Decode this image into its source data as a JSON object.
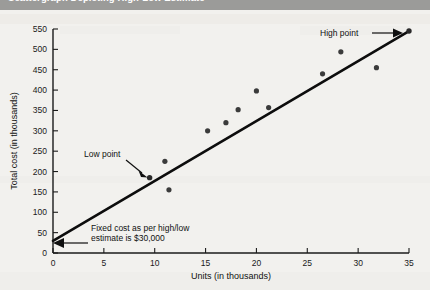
{
  "title": "Scattergraph Depicting High-Low Estimate",
  "chart_data": {
    "type": "scatter",
    "title": "Scattergraph Depicting High-Low Estimate",
    "xlabel": "Units (in thousands)",
    "ylabel": "Total cost (in thousands)",
    "xlim": [
      0,
      35
    ],
    "ylim": [
      0,
      550
    ],
    "xticks": [
      0,
      5,
      10,
      15,
      20,
      25,
      30,
      35
    ],
    "yticks": [
      0,
      50,
      100,
      150,
      200,
      250,
      300,
      350,
      400,
      450,
      500,
      550
    ],
    "grid": false,
    "legend": "none",
    "points": [
      {
        "x": 9.5,
        "y": 185,
        "label": "Low point"
      },
      {
        "x": 11.0,
        "y": 225
      },
      {
        "x": 11.4,
        "y": 155
      },
      {
        "x": 15.2,
        "y": 300
      },
      {
        "x": 17.0,
        "y": 320
      },
      {
        "x": 18.2,
        "y": 352
      },
      {
        "x": 20.0,
        "y": 398
      },
      {
        "x": 21.2,
        "y": 357
      },
      {
        "x": 26.5,
        "y": 440
      },
      {
        "x": 28.3,
        "y": 494
      },
      {
        "x": 31.8,
        "y": 455
      },
      {
        "x": 35.0,
        "y": 545,
        "label": "High point"
      }
    ],
    "trendline": {
      "name": "High-low cost line",
      "x0": 0,
      "y0": 30,
      "x1": 35,
      "y1": 545,
      "intercept": 30,
      "slope": 14.71
    },
    "annotations": [
      {
        "name": "high-point",
        "text": "High point",
        "x": 35,
        "y": 545
      },
      {
        "name": "low-point",
        "text": "Low point",
        "x": 9.5,
        "y": 185
      },
      {
        "name": "fixed-cost",
        "text_line1": "Fixed cost as per high/low",
        "text_line2": "estimate is $30,000",
        "x": 0,
        "y": 30
      }
    ]
  },
  "colors": {
    "title_band": "#9b9b99",
    "page_background": "#f2f1ee",
    "axis": "#1b1b1b",
    "trendline": "#0d0d0d",
    "dot": "#3b3b3b"
  }
}
